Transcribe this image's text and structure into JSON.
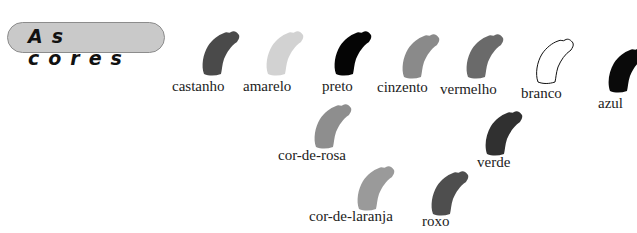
{
  "title": "As cores",
  "colors": [
    {
      "label": "castanho",
      "fill": "#4a4a4a",
      "stroke": "none",
      "x": 198,
      "y": 30,
      "lx": 172,
      "ly": 78
    },
    {
      "label": "amarelo",
      "fill": "#d2d2d2",
      "stroke": "none",
      "x": 262,
      "y": 30,
      "lx": 243,
      "ly": 78
    },
    {
      "label": "preto",
      "fill": "#050505",
      "stroke": "none",
      "x": 330,
      "y": 30,
      "lx": 322,
      "ly": 78
    },
    {
      "label": "cinzento",
      "fill": "#8a8a8a",
      "stroke": "none",
      "x": 398,
      "y": 33,
      "lx": 377,
      "ly": 79
    },
    {
      "label": "vermelho",
      "fill": "#6a6a6a",
      "stroke": "none",
      "x": 462,
      "y": 33,
      "lx": 440,
      "ly": 81
    },
    {
      "label": "branco",
      "fill": "#ffffff",
      "stroke": "#111111",
      "x": 532,
      "y": 38,
      "lx": 521,
      "ly": 85
    },
    {
      "label": "azul",
      "fill": "#0a0a0a",
      "stroke": "none",
      "x": 604,
      "y": 47,
      "lx": 598,
      "ly": 95
    },
    {
      "label": "cor-de-rosa",
      "fill": "#8e8e8e",
      "stroke": "none",
      "x": 310,
      "y": 103,
      "lx": 278,
      "ly": 147
    },
    {
      "label": "verde",
      "fill": "#303030",
      "stroke": "none",
      "x": 481,
      "y": 110,
      "lx": 477,
      "ly": 154
    },
    {
      "label": "cor-de-laranja",
      "fill": "#9a9a9a",
      "stroke": "none",
      "x": 353,
      "y": 165,
      "lx": 309,
      "ly": 208
    },
    {
      "label": "roxo",
      "fill": "#4e4e4e",
      "stroke": "none",
      "x": 427,
      "y": 170,
      "lx": 422,
      "ly": 213
    }
  ]
}
